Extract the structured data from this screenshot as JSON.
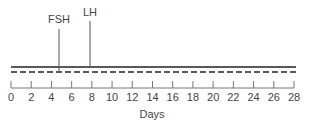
{
  "chart_data": {
    "type": "line",
    "title": "",
    "xlabel": "Days",
    "ylabel": "",
    "xlim": [
      0,
      28
    ],
    "x_ticks": [
      0,
      2,
      4,
      6,
      8,
      10,
      12,
      14,
      16,
      18,
      20,
      22,
      24,
      26,
      28
    ],
    "x_tick_labels": [
      "0",
      "2",
      "4",
      "6",
      "8",
      "10",
      "12",
      "14",
      "16",
      "18",
      "20",
      "22",
      "24",
      "26",
      "28"
    ],
    "grid": false,
    "series": [
      {
        "name": "solid",
        "style": "solid",
        "x": [
          0,
          28
        ],
        "y": [
          1,
          1
        ]
      },
      {
        "name": "dashed",
        "style": "dashed",
        "x": [
          0,
          28
        ],
        "y": [
          0,
          0
        ]
      }
    ],
    "annotations": [
      {
        "label": "FSH",
        "x": 4.7
      },
      {
        "label": "LH",
        "x": 7.8
      }
    ]
  },
  "axis": {
    "label": "Days"
  },
  "markers": [
    {
      "label": "FSH"
    },
    {
      "label": "LH"
    }
  ]
}
